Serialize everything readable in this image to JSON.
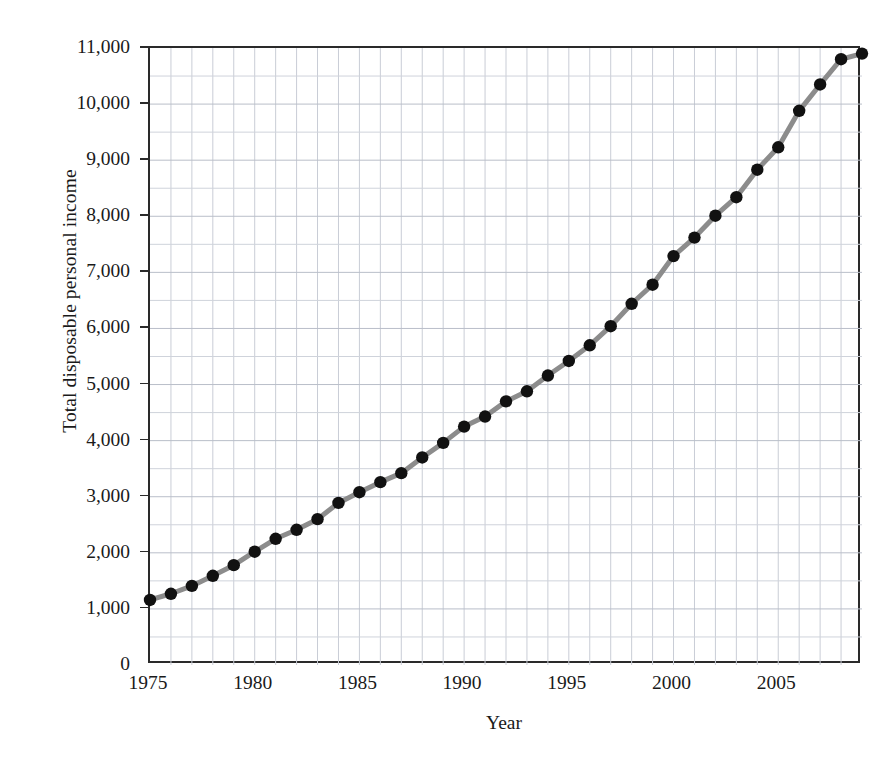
{
  "chart_data": {
    "type": "line",
    "title": "",
    "xlabel": "Year",
    "ylabel": "Total disposable personal income",
    "xlim": [
      1975,
      2009
    ],
    "ylim": [
      0,
      11000
    ],
    "grid": true,
    "legend": "none",
    "x_major_ticks": [
      1975,
      1980,
      1985,
      1990,
      1995,
      2000,
      2005
    ],
    "x_minor_step": 1,
    "y_major_ticks": [
      0,
      1000,
      2000,
      3000,
      4000,
      5000,
      6000,
      7000,
      8000,
      9000,
      10000,
      11000
    ],
    "y_tick_labels": [
      "0",
      "1,000",
      "2,000",
      "3,000",
      "4,000",
      "5,000",
      "6,000",
      "7,000",
      "8,000",
      "9,000",
      "10,000",
      "11,000"
    ],
    "y_minor_step": 500,
    "series": [
      {
        "name": "Total disposable personal income",
        "line_color": "#8c8c8c",
        "marker_color": "#111111",
        "marker": "circle",
        "x": [
          1975,
          1976,
          1977,
          1978,
          1979,
          1980,
          1981,
          1982,
          1983,
          1984,
          1985,
          1986,
          1987,
          1988,
          1989,
          1990,
          1991,
          1992,
          1993,
          1994,
          1995,
          1996,
          1997,
          1998,
          1999,
          2000,
          2001,
          2002,
          2003,
          2004,
          2005,
          2006,
          2007,
          2008,
          2009
        ],
        "values": [
          1160,
          1270,
          1410,
          1590,
          1780,
          2020,
          2250,
          2410,
          2600,
          2890,
          3080,
          3260,
          3420,
          3700,
          3960,
          4250,
          4430,
          4700,
          4880,
          5160,
          5420,
          5700,
          6040,
          6440,
          6780,
          7290,
          7620,
          8010,
          8340,
          8830,
          9230,
          9880,
          10350,
          10800,
          10900
        ]
      }
    ]
  }
}
